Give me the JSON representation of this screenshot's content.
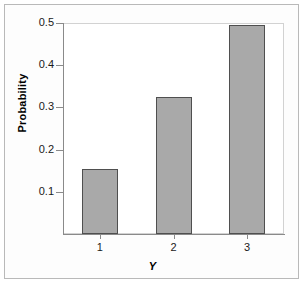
{
  "chart_data": {
    "type": "bar",
    "title": "",
    "xlabel": "Y",
    "ylabel": "Probability",
    "categories": [
      "1",
      "2",
      "3"
    ],
    "values": [
      0.155,
      0.325,
      0.495
    ],
    "ylim": [
      0.0,
      0.5
    ],
    "yticks": [
      0.1,
      0.2,
      0.3,
      0.4,
      0.5
    ],
    "ytick_labels": [
      "0.1",
      "0.2",
      "0.3",
      "0.4",
      "0.5"
    ],
    "grid": false,
    "legend": null,
    "bar_fill_color": "#a9a9a9",
    "bar_border_color": "#4f4f4f",
    "panel_background": "#ffffff",
    "figure_background": "#fdfdfd",
    "axis_color": "#8a8a8a"
  },
  "axes": {
    "y_title": "Probability",
    "x_title": "Y",
    "y_tick_labels": [
      "0.5",
      "0.4",
      "0.3",
      "0.2",
      "0.1"
    ],
    "x_tick_labels": [
      "1",
      "2",
      "3"
    ]
  }
}
